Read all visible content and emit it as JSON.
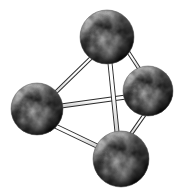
{
  "figure": {
    "name": "tetrahedral-molecular-model",
    "caption": "",
    "width": 177,
    "height": 191,
    "background_color": "#ffffff",
    "render_style": "stippled halftone line engraving",
    "light_direction": "upper-left"
  },
  "palette": {
    "background": "#ffffff",
    "stipple_dark": "#1a1a1a",
    "stipple_mid": "#6b6b6b",
    "stipple_light": "#d8d8d8",
    "bond_outline": "#2b2b2b",
    "bond_fill": "#fbfbfb",
    "sphere_shadow": "#3a3a3a",
    "sphere_highlight": "#f2f2f2"
  },
  "atoms": [
    {
      "id": "atom-top",
      "label": "top",
      "cx": 107,
      "cy": 37,
      "r": 27,
      "highlight_x": 96,
      "highlight_y": 24,
      "shade": "dark-lower-right"
    },
    {
      "id": "atom-left",
      "label": "left",
      "cx": 37,
      "cy": 109,
      "r": 26,
      "highlight_x": 27,
      "highlight_y": 97,
      "shade": "dark-lower-right"
    },
    {
      "id": "atom-right",
      "label": "right",
      "cx": 148,
      "cy": 91,
      "r": 25,
      "highlight_x": 139,
      "highlight_y": 80,
      "shade": "dark-lower-right"
    },
    {
      "id": "atom-bottom",
      "label": "bottom",
      "cx": 121,
      "cy": 159,
      "r": 28,
      "highlight_x": 110,
      "highlight_y": 146,
      "shade": "dark-lower-right"
    }
  ],
  "bonds": [
    {
      "id": "bond-top-left",
      "from": "atom-top",
      "to": "atom-left",
      "x1": 92,
      "y1": 57,
      "x2": 52,
      "y2": 96,
      "width": 4
    },
    {
      "id": "bond-top-right",
      "from": "atom-top",
      "to": "atom-right",
      "x1": 127,
      "y1": 50,
      "x2": 140,
      "y2": 70,
      "width": 4
    },
    {
      "id": "bond-top-bottom",
      "from": "atom-top",
      "to": "atom-bottom",
      "x1": 110,
      "y1": 63,
      "x2": 117,
      "y2": 132,
      "width": 5
    },
    {
      "id": "bond-left-right",
      "from": "atom-left",
      "to": "atom-right",
      "x1": 61,
      "y1": 106,
      "x2": 126,
      "y2": 97,
      "width": 5
    },
    {
      "id": "bond-left-bottom",
      "from": "atom-left",
      "to": "atom-bottom",
      "x1": 53,
      "y1": 125,
      "x2": 99,
      "y2": 147,
      "width": 5
    },
    {
      "id": "bond-right-bottom",
      "from": "atom-right",
      "to": "atom-bottom",
      "x1": 145,
      "y1": 114,
      "x2": 131,
      "y2": 134,
      "width": 4
    }
  ],
  "structure": {
    "atom_count": 4,
    "bond_count": 6,
    "geometry": "tetrahedron"
  }
}
